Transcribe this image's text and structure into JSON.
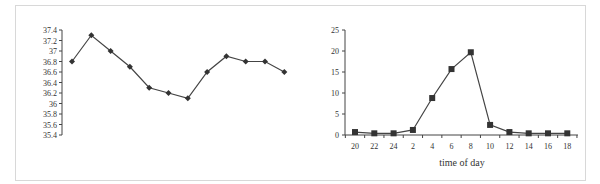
{
  "chart_data": [
    {
      "type": "line",
      "title": "",
      "xlabel": "",
      "ylabel": "",
      "ylim": [
        35.4,
        37.4
      ],
      "yticks": [
        "37.4",
        "37.2",
        "37",
        "36.8",
        "36.6",
        "36.4",
        "36.2",
        "36",
        "35.8",
        "35.6",
        "35.4"
      ],
      "x_axis_shown": false,
      "grid": false,
      "marker": "diamond",
      "series": [
        {
          "name": "temperature",
          "values": [
            36.8,
            37.3,
            37.0,
            36.7,
            36.3,
            36.2,
            36.1,
            36.6,
            36.9,
            36.8,
            36.8,
            36.6
          ]
        }
      ]
    },
    {
      "type": "line",
      "title": "",
      "xlabel": "time of day",
      "ylabel": "",
      "ylim": [
        0,
        25
      ],
      "yticks": [
        "25",
        "20",
        "15",
        "10",
        "5",
        "0"
      ],
      "categories": [
        "20",
        "22",
        "24",
        "2",
        "4",
        "6",
        "8",
        "10",
        "12",
        "14",
        "16",
        "18"
      ],
      "grid": false,
      "marker": "square",
      "series": [
        {
          "name": "value",
          "values": [
            0.7,
            0.4,
            0.4,
            1.2,
            8.8,
            15.7,
            19.7,
            2.4,
            0.7,
            0.4,
            0.4,
            0.4
          ]
        }
      ]
    }
  ]
}
